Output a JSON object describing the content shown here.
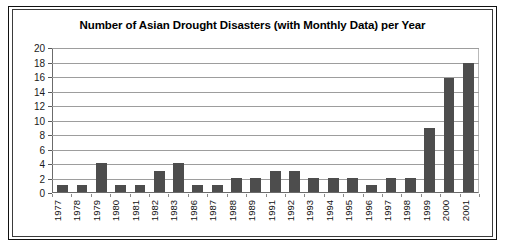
{
  "chart_data": {
    "type": "bar",
    "title": "Number of Asian Drought Disasters (with Monthly Data) per Year",
    "xlabel": "",
    "ylabel": "",
    "ylim": [
      0,
      20
    ],
    "ytick_step": 2,
    "yticks": [
      0,
      2,
      4,
      6,
      8,
      10,
      12,
      14,
      16,
      18,
      20
    ],
    "grid": true,
    "legend": null,
    "bar_color": "#4d4d4d",
    "categories": [
      "1977",
      "1978",
      "1979",
      "1980",
      "1981",
      "1982",
      "1983",
      "1986",
      "1987",
      "1988",
      "1989",
      "1991",
      "1992",
      "1993",
      "1994",
      "1995",
      "1996",
      "1997",
      "1998",
      "1999",
      "2000",
      "2001"
    ],
    "values": [
      1,
      1,
      4,
      1,
      1,
      3,
      4,
      1,
      1,
      2,
      2,
      3,
      3,
      2,
      2,
      2,
      1,
      2,
      2,
      9,
      16,
      18
    ]
  },
  "figure": {
    "frame_color": "#111111",
    "inner_frame_color": "#3b3b3b",
    "background": "#ffffff",
    "axis_color": "#6b6b6b",
    "gridline_color": "#9d9d9d"
  }
}
